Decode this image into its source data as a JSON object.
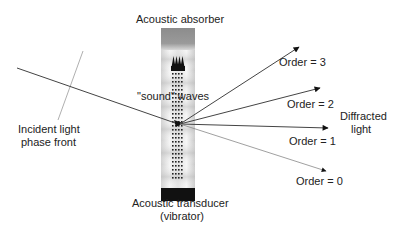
{
  "diagram": {
    "labels": {
      "absorber": "Acoustic absorber",
      "sound_waves": "\"sound\" waves",
      "incident_line1": "Incident light",
      "incident_line2": "phase front",
      "transducer_line1": "Acoustic transducer",
      "transducer_line2": "(vibrator)",
      "diffracted_line1": "Diffracted",
      "diffracted_line2": "light"
    },
    "orders": [
      {
        "label": "Order = 3",
        "order": 3
      },
      {
        "label": "Order = 2",
        "order": 2
      },
      {
        "label": "Order = 1",
        "order": 1
      },
      {
        "label": "Order = 0",
        "order": 0
      }
    ],
    "colors": {
      "line": "#444444",
      "faint_line": "#999999",
      "absorber_gray": "#8a8a8a",
      "transducer": "#111111"
    }
  }
}
